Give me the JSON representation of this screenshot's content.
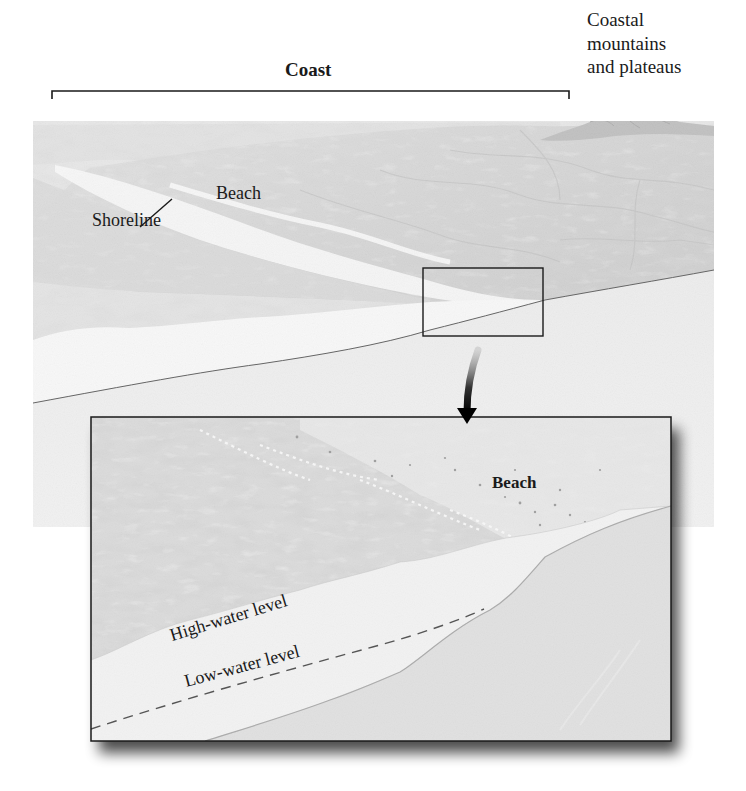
{
  "diagram": {
    "labels": {
      "coast": "Coast",
      "coastal_mountains": [
        "Coastal",
        "mountains",
        "and plateaus"
      ],
      "beach_main": "Beach",
      "shoreline": "Shoreline",
      "beach_inset": "Beach",
      "high_water": "High-water level",
      "low_water": "Low-water level"
    },
    "colors": {
      "background": "#ffffff",
      "land_dark": "#8e8e8e",
      "land_mid": "#a9a9a9",
      "land_light": "#c8c8c8",
      "beach_sand": "#e9e9e9",
      "water": "#cfcfcf",
      "frame": "#1a1a1a"
    }
  }
}
